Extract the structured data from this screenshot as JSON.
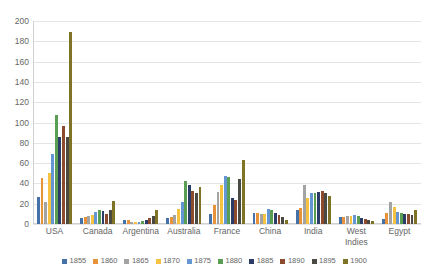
{
  "chart_data": {
    "type": "bar",
    "title": "",
    "subtitle": "",
    "xlabel": "",
    "ylabel": "",
    "ylim": [
      0,
      200
    ],
    "ytick_step": 20,
    "yticks": [
      200,
      180,
      160,
      140,
      120,
      100,
      80,
      60,
      40,
      20,
      0
    ],
    "grid": true,
    "legend_position": "bottom",
    "categories": [
      "USA",
      "Canada",
      "Argentina",
      "Australia",
      "France",
      "China",
      "India",
      "West Indies",
      "Egypt"
    ],
    "series": [
      {
        "name": "1855",
        "color": "#4472a8",
        "values": [
          27,
          6,
          4,
          6,
          10,
          11,
          14,
          7,
          5
        ]
      },
      {
        "name": "1860",
        "color": "#e8923c",
        "values": [
          45,
          7,
          4,
          7,
          19,
          11,
          16,
          7,
          11
        ]
      },
      {
        "name": "1865",
        "color": "#a3a3a3",
        "values": [
          22,
          8,
          2,
          9,
          32,
          10,
          38,
          8,
          22
        ]
      },
      {
        "name": "1870",
        "color": "#f5c242",
        "values": [
          50,
          9,
          2,
          15,
          38,
          10,
          26,
          8,
          17
        ]
      },
      {
        "name": "1875",
        "color": "#6596d4",
        "values": [
          69,
          12,
          2,
          22,
          47,
          15,
          31,
          9,
          12
        ]
      },
      {
        "name": "1880",
        "color": "#5a9e54",
        "values": [
          107,
          14,
          3,
          42,
          46,
          14,
          31,
          8,
          11
        ]
      },
      {
        "name": "1885",
        "color": "#2b3d66",
        "values": [
          86,
          13,
          4,
          38,
          26,
          11,
          32,
          6,
          10
        ]
      },
      {
        "name": "1890",
        "color": "#8c4a2f",
        "values": [
          97,
          10,
          6,
          33,
          24,
          9,
          33,
          5,
          10
        ]
      },
      {
        "name": "1895",
        "color": "#4a4a42",
        "values": [
          86,
          14,
          8,
          31,
          44,
          7,
          31,
          4,
          9
        ]
      },
      {
        "name": "1900",
        "color": "#7f7325",
        "values": [
          189,
          23,
          14,
          36,
          63,
          4,
          28,
          3,
          14
        ]
      }
    ]
  }
}
